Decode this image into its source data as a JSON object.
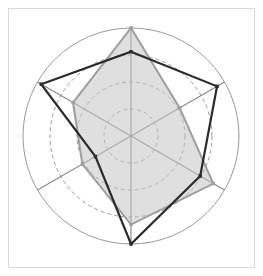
{
  "figure": {
    "title": "",
    "frame": {
      "x": 8,
      "y": 8,
      "width": 247,
      "height": 260,
      "stroke": "#d9d9d9",
      "fill": "#ffffff"
    },
    "background_color": "#ffffff"
  },
  "chart_data": {
    "type": "radar",
    "title": "",
    "subtitle": "",
    "xlabel": "",
    "ylabel": "",
    "categories": [
      "A1",
      "A2",
      "A3",
      "A4",
      "A5",
      "A6"
    ],
    "tick_labels": [],
    "axis_count": 6,
    "axis_angles_deg": [
      90,
      30,
      -30,
      -90,
      -150,
      150
    ],
    "rlim": [
      0,
      1.0
    ],
    "grid": true,
    "grid_rings": [
      0.25,
      0.5,
      0.75
    ],
    "grid_style": "dashed",
    "grid_color": "#9a9a9a",
    "outer_ring": 1.0,
    "outer_ring_color": "#9a9a9a",
    "spoke_color": "#8c8c8c",
    "legend_position": "none",
    "legend": [],
    "center": {
      "cx": 131,
      "cy": 136
    },
    "radius_px": 108,
    "series": [
      {
        "name": "Series 1",
        "color": "#9e9e9e",
        "fill": "#c4c4c4",
        "fill_opacity": 0.55,
        "line_width": 2,
        "marker": "square",
        "values": [
          1.0,
          0.52,
          0.88,
          0.82,
          0.52,
          0.62
        ]
      },
      {
        "name": "Series 2",
        "color": "#2b2b2b",
        "fill": "none",
        "fill_opacity": 0,
        "line_width": 2.2,
        "marker": "square",
        "values": [
          0.78,
          0.92,
          0.74,
          1.0,
          0.38,
          0.96
        ]
      }
    ]
  }
}
